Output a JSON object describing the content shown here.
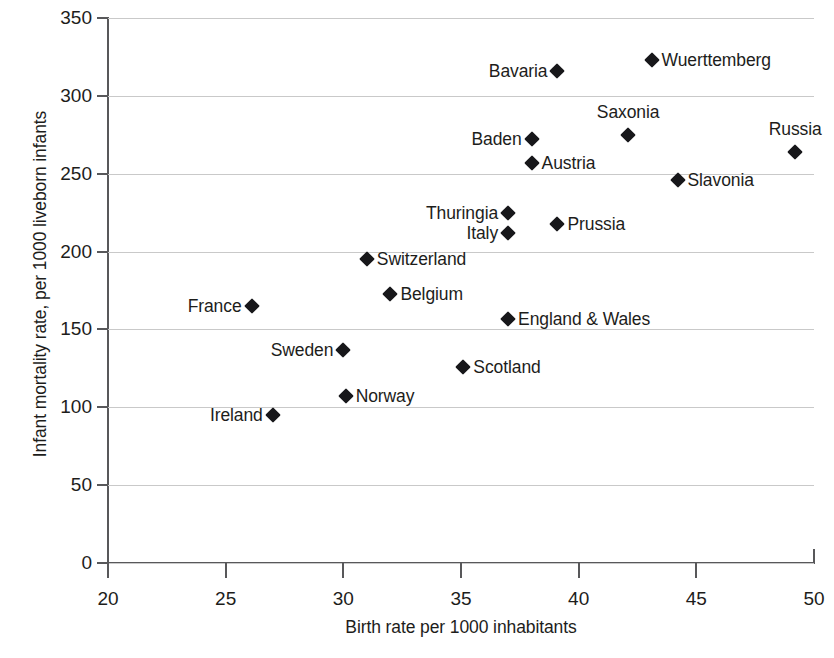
{
  "chart_data": {
    "type": "scatter",
    "title": "",
    "xlabel": "Birth rate per 1000 inhabitants",
    "ylabel": "Infant mortality rate, per 1000 liveborn infants",
    "xlim": [
      20,
      50
    ],
    "ylim": [
      0,
      350
    ],
    "xticks": [
      20,
      25,
      30,
      35,
      40,
      45,
      50
    ],
    "yticks": [
      0,
      50,
      100,
      150,
      200,
      250,
      300,
      350
    ],
    "grid": "horizontal",
    "legend": "none",
    "marker_shape": "filled-diamond",
    "marker_color": "#17171a",
    "points": [
      {
        "label": "Wuerttemberg",
        "x": 43.1,
        "y": 323,
        "label_side": "right"
      },
      {
        "label": "Bavaria",
        "x": 39.1,
        "y": 316,
        "label_side": "left"
      },
      {
        "label": "Saxonia",
        "x": 42.1,
        "y": 275,
        "label_side": "above"
      },
      {
        "label": "Baden",
        "x": 38.0,
        "y": 272,
        "label_side": "left"
      },
      {
        "label": "Russia",
        "x": 49.2,
        "y": 264,
        "label_side": "above"
      },
      {
        "label": "Austria",
        "x": 38.0,
        "y": 257,
        "label_side": "right"
      },
      {
        "label": "Slavonia",
        "x": 44.2,
        "y": 246,
        "label_side": "right"
      },
      {
        "label": "Thuringia",
        "x": 37.0,
        "y": 225,
        "label_side": "left"
      },
      {
        "label": "Prussia",
        "x": 39.1,
        "y": 218,
        "label_side": "right"
      },
      {
        "label": "Italy",
        "x": 37.0,
        "y": 212,
        "label_side": "left"
      },
      {
        "label": "Switzerland",
        "x": 31.0,
        "y": 195,
        "label_side": "right"
      },
      {
        "label": "Belgium",
        "x": 32.0,
        "y": 173,
        "label_side": "right"
      },
      {
        "label": "France",
        "x": 26.1,
        "y": 165,
        "label_side": "left"
      },
      {
        "label": "England & Wales",
        "x": 37.0,
        "y": 157,
        "label_side": "right"
      },
      {
        "label": "Sweden",
        "x": 30.0,
        "y": 137,
        "label_side": "left"
      },
      {
        "label": "Scotland",
        "x": 35.1,
        "y": 126,
        "label_side": "right"
      },
      {
        "label": "Norway",
        "x": 30.1,
        "y": 107,
        "label_side": "right"
      },
      {
        "label": "Ireland",
        "x": 27.0,
        "y": 95,
        "label_side": "left"
      }
    ]
  }
}
